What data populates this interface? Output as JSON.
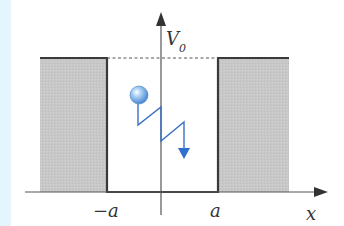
{
  "diagram": {
    "axes": {
      "x_label": "x",
      "y_label": "V",
      "y_label_subscript": "0"
    },
    "tick_labels": {
      "left_wall": "−a",
      "right_wall": "a"
    },
    "colors": {
      "barrier_fill": "#c9c9c9",
      "barrier_edge": "#3a3a3a",
      "particle": "#6aa8e8",
      "path": "#3a6fc4",
      "axis": "#555555",
      "side_strip": "#e4f5fb"
    },
    "elements": [
      "left potential barrier (height V0)",
      "right potential barrier (height V0)",
      "well floor between -a and a",
      "dotted line at V0 level",
      "particle (ball) with zigzag trajectory arrow"
    ]
  }
}
